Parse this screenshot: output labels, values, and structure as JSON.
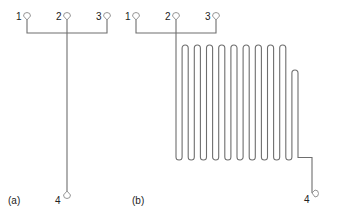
{
  "diagram": {
    "panels": [
      {
        "id": "a",
        "caption": "(a)",
        "channel": "straight",
        "ports": [
          {
            "label": "1"
          },
          {
            "label": "2"
          },
          {
            "label": "3"
          },
          {
            "label": "4"
          }
        ]
      },
      {
        "id": "b",
        "caption": "(b)",
        "channel": "serpentine",
        "serpentine_full_loops": 9,
        "serpentine_short_loops": 1,
        "ports": [
          {
            "label": "1"
          },
          {
            "label": "2"
          },
          {
            "label": "3"
          },
          {
            "label": "4"
          }
        ]
      }
    ],
    "colors": {
      "channel": "#6e6e6e",
      "port": "#8a8a8a",
      "text": "#222222"
    }
  }
}
